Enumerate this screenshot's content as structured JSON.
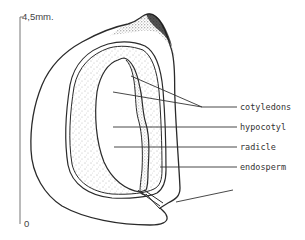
{
  "diagram": {
    "scale": {
      "top_label": "4,5mm.",
      "bottom_label": "0"
    },
    "labels": [
      {
        "id": "cotyledons",
        "text": "cotyledons"
      },
      {
        "id": "hypocotyl",
        "text": "hypocotyl"
      },
      {
        "id": "radicle",
        "text": "radicle"
      },
      {
        "id": "endosperm",
        "text": "endosperm"
      }
    ],
    "colors": {
      "line": "#2a2a2a",
      "stipple": "#555555",
      "background": "#ffffff"
    }
  }
}
